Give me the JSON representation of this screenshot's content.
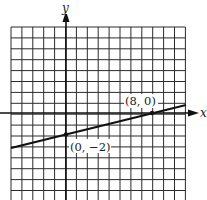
{
  "chart_data": {
    "type": "line",
    "title": "",
    "xlabel": "x",
    "ylabel": "y",
    "grid": true,
    "xlim": [
      -5,
      11
    ],
    "ylim": [
      -8,
      8
    ],
    "series": [
      {
        "name": "line",
        "equation": "y = 0.25x - 2",
        "x": [
          -5,
          11
        ],
        "y": [
          -3.25,
          0.75
        ]
      }
    ],
    "points": [
      {
        "x": 0,
        "y": -2,
        "label": "(0, −2)"
      },
      {
        "x": 8,
        "y": 0,
        "label": "(8, 0)"
      }
    ]
  },
  "axes": {
    "x_label": "x",
    "y_label": "y"
  },
  "annotations": {
    "point_a": "(0, −2)",
    "point_b": "(8, 0)"
  },
  "colors": {
    "grid": "#2a2a2a",
    "axis": "#111111",
    "line": "#111111",
    "background": "#ffffff"
  }
}
